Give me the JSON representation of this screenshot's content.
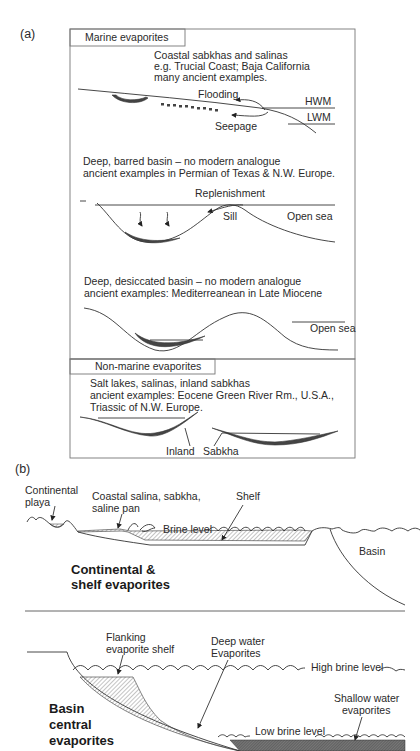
{
  "panel_a": {
    "label": "(a)",
    "marine": {
      "header": "Marine evaporites",
      "coastal": {
        "line1": "Coastal sabkhas and salinas",
        "line2": "e.g. Trucial Coast; Baja California",
        "line3": "many ancient examples.",
        "flooding": "Flooding",
        "seepage": "Seepage",
        "hwm": "HWM",
        "lwm": "LWM"
      },
      "barred": {
        "line1": "Deep, barred basin – no modern analogue",
        "line2": "ancient examples in Permian of Texas & N.W. Europe.",
        "replenishment": "Replenishment",
        "sill": "Sill",
        "open_sea": "Open sea"
      },
      "desiccated": {
        "line1": "Deep, desiccated basin – no modern analogue",
        "line2": "ancient examples: Mediterreanean in Late Miocene",
        "open_sea": "Open sea"
      }
    },
    "nonmarine": {
      "header": "Non-marine evaporites",
      "line1": "Salt lakes, salinas, inland sabkhas",
      "line2": "ancient examples: Eocene Green River Rm., U.S.A.,",
      "line3": "Triassic of N.W. Europe.",
      "inland": "Inland",
      "sabkha": "Sabkha"
    }
  },
  "panel_b": {
    "label": "(b)",
    "top": {
      "continental_playa_1": "Continental",
      "continental_playa_2": "playa",
      "coastal_1": "Coastal salina, sabkha,",
      "coastal_2": "saline pan",
      "shelf": "Shelf",
      "brine_level": "Brine level",
      "basin": "Basin",
      "title_1": "Continental &",
      "title_2": "shelf evaporites"
    },
    "bottom": {
      "flanking_1": "Flanking",
      "flanking_2": "evaporite shelf",
      "deep_1": "Deep water",
      "deep_2": "Evaporites",
      "high_brine": "High brine level",
      "shallow_1": "Shallow water",
      "shallow_2": "evaporites",
      "low_brine": "Low brine level",
      "title_1": "Basin",
      "title_2": "central",
      "title_3": "evaporites"
    }
  }
}
